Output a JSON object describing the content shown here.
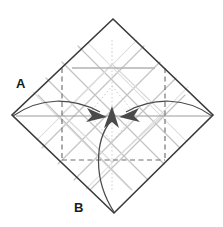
{
  "figure": {
    "type": "origami-fold-diagram",
    "title": "",
    "background_color": "#ffffff",
    "width": 223,
    "height": 227
  },
  "labels": [
    {
      "name": "label-a",
      "text": "A",
      "x": 16,
      "y": 88
    },
    {
      "name": "label-b",
      "text": "B",
      "x": 74,
      "y": 212
    }
  ],
  "colors": {
    "outline": "#3a3a3a",
    "crease_gray": "#b9b9b9",
    "crease_light": "#d8d8d8",
    "dashed": "#6f6f6f",
    "arrow": "#4a4a4a",
    "dotted": "#c9c9c9",
    "label": "#1a1a1a"
  },
  "geometry": {
    "square_vertices": {
      "top": {
        "x": 113,
        "y": 19
      },
      "right": {
        "x": 213,
        "y": 115
      },
      "bottom": {
        "x": 114,
        "y": 213
      },
      "left": {
        "x": 12,
        "y": 115
      }
    },
    "center": {
      "x": 112,
      "y": 114
    },
    "inner_dashed_square": {
      "left": 62,
      "right": 165,
      "top": 68,
      "bottom": 160
    }
  },
  "arrows": [
    {
      "name": "fold-arrow-left",
      "from": {
        "x": 13,
        "y": 116
      },
      "to": {
        "x": 102,
        "y": 117
      },
      "direction": "right",
      "style": "curved"
    },
    {
      "name": "fold-arrow-right",
      "from": {
        "x": 212,
        "y": 116
      },
      "to": {
        "x": 124,
        "y": 117
      },
      "direction": "left",
      "style": "curved"
    },
    {
      "name": "fold-arrow-bottom",
      "from": {
        "x": 114,
        "y": 212
      },
      "to": {
        "x": 112,
        "y": 110
      },
      "direction": "up",
      "style": "curved"
    }
  ],
  "crease_lines": {
    "description": "light gray pre-existing crease pattern with diagonal grid and horizontal line",
    "horizontal_top": {
      "x1": 72,
      "y1": 68,
      "x2": 155,
      "y2": 68
    },
    "horizontal_center": {
      "x1": 18,
      "y1": 116,
      "x2": 208,
      "y2": 116
    }
  }
}
